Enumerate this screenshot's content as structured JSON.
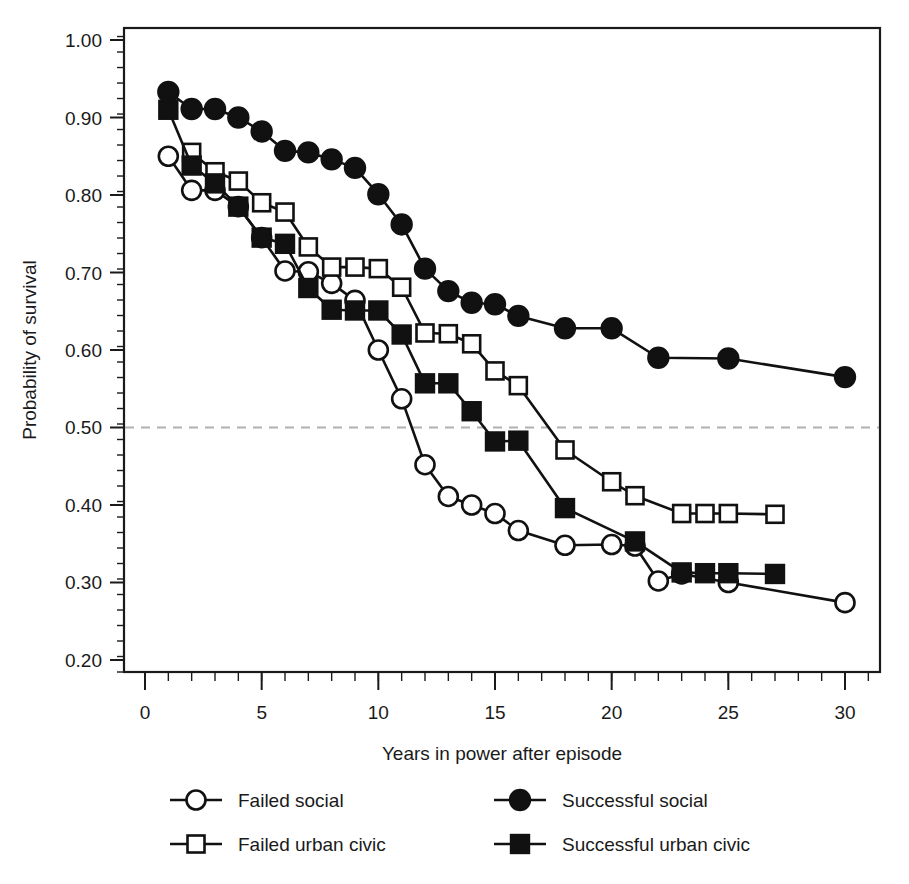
{
  "chart_data": {
    "type": "line",
    "title": "",
    "xlabel": "Years in power after episode",
    "ylabel": "Probability of survival",
    "xlim": [
      -0.9,
      31.5
    ],
    "ylim": [
      0.1845,
      1.0155
    ],
    "xticks": [
      0,
      5,
      10,
      15,
      20,
      25,
      30
    ],
    "xtick_labels": [
      "0",
      "5",
      "10",
      "15",
      "20",
      "25",
      "30"
    ],
    "x_minor_tick_step": 1,
    "yticks": [
      0.2,
      0.3,
      0.4,
      0.5,
      0.6,
      0.7,
      0.8,
      0.9,
      1.0
    ],
    "ytick_labels": [
      "0.20",
      "0.30",
      "0.40",
      "0.50",
      "0.60",
      "0.70",
      "0.80",
      "0.90",
      "1.00"
    ],
    "y_minor_tick_step": 0.02,
    "grid": false,
    "reference_line": {
      "y": 0.5,
      "style": "dashed",
      "color": "#b0b0b0"
    },
    "legend_position": "below-axes",
    "series": [
      {
        "name": "Failed social",
        "marker": "open-circle",
        "color": "#111111",
        "x": [
          1,
          2,
          3,
          4,
          5,
          6,
          7,
          8,
          9,
          10,
          11,
          12,
          13,
          14,
          15,
          16,
          18,
          20,
          21,
          22,
          23,
          25,
          30
        ],
        "y": [
          0.85,
          0.806,
          0.806,
          0.785,
          0.745,
          0.702,
          0.701,
          0.686,
          0.664,
          0.6,
          0.537,
          0.452,
          0.411,
          0.4,
          0.389,
          0.367,
          0.348,
          0.349,
          0.347,
          0.302,
          0.311,
          0.3,
          0.274
        ]
      },
      {
        "name": "Failed urban civic",
        "marker": "open-square",
        "color": "#111111",
        "x": [
          2,
          3,
          4,
          5,
          6,
          7,
          8,
          9,
          10,
          11,
          12,
          13,
          14,
          15,
          16,
          18,
          20,
          21,
          23,
          24,
          25,
          27
        ],
        "y": [
          0.855,
          0.83,
          0.818,
          0.79,
          0.778,
          0.733,
          0.707,
          0.707,
          0.705,
          0.681,
          0.622,
          0.621,
          0.608,
          0.573,
          0.554,
          0.471,
          0.43,
          0.412,
          0.389,
          0.389,
          0.389,
          0.388
        ]
      },
      {
        "name": "Successful social",
        "marker": "filled-circle",
        "color": "#111111",
        "x": [
          1,
          2,
          3,
          4,
          5,
          6,
          7,
          8,
          9,
          10,
          11,
          12,
          13,
          14,
          15,
          16,
          18,
          20,
          22,
          25,
          30
        ],
        "y": [
          0.933,
          0.911,
          0.911,
          0.9,
          0.882,
          0.857,
          0.855,
          0.846,
          0.835,
          0.801,
          0.762,
          0.705,
          0.676,
          0.661,
          0.659,
          0.644,
          0.628,
          0.628,
          0.59,
          0.589,
          0.565
        ]
      },
      {
        "name": "Successful urban civic",
        "marker": "filled-square",
        "color": "#111111",
        "x": [
          1,
          2,
          3,
          4,
          5,
          6,
          7,
          8,
          9,
          10,
          11,
          12,
          13,
          14,
          15,
          16,
          18,
          21,
          23,
          24,
          25,
          27
        ],
        "y": [
          0.91,
          0.838,
          0.815,
          0.785,
          0.745,
          0.737,
          0.68,
          0.652,
          0.651,
          0.651,
          0.62,
          0.557,
          0.557,
          0.521,
          0.482,
          0.483,
          0.396,
          0.353,
          0.313,
          0.312,
          0.312,
          0.311
        ]
      }
    ],
    "legend": [
      {
        "label": "Failed social",
        "marker": "open-circle"
      },
      {
        "label": "Successful social",
        "marker": "filled-circle"
      },
      {
        "label": "Failed urban civic",
        "marker": "open-square"
      },
      {
        "label": "Successful urban civic",
        "marker": "filled-square"
      }
    ]
  }
}
